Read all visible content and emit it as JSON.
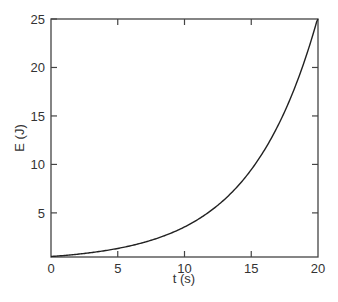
{
  "chart_data": {
    "type": "line",
    "title": "",
    "xlabel": "t (s)",
    "ylabel": "E (J)",
    "xlim": [
      0,
      20
    ],
    "ylim": [
      0.45,
      25
    ],
    "grid": false,
    "legend": null,
    "x_ticks": [
      0,
      5,
      10,
      15,
      20
    ],
    "y_ticks": [
      5,
      10,
      15,
      20,
      25
    ],
    "series": [
      {
        "name": "E(t)",
        "color": "#222222",
        "x": [
          0,
          2,
          4,
          6,
          8,
          10,
          12,
          14,
          16,
          18,
          20
        ],
        "values": [
          0.5,
          0.74,
          1.09,
          1.62,
          2.4,
          3.55,
          5.26,
          7.78,
          11.5,
          17.0,
          25.2
        ]
      }
    ]
  },
  "axes": {
    "x_label": "t (s)",
    "y_label": "E (J)",
    "x_tick_labels": [
      "0",
      "5",
      "10",
      "15",
      "20"
    ],
    "y_tick_labels": [
      "5",
      "10",
      "15",
      "20",
      "25"
    ]
  }
}
